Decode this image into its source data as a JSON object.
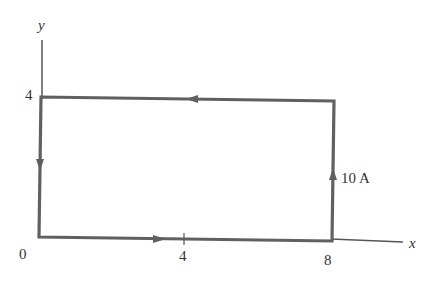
{
  "diagram": {
    "axes": {
      "x_label": "x",
      "y_label": "y",
      "origin_label": "0",
      "x_ticks": [
        "4",
        "8"
      ],
      "y_ticks": [
        "4"
      ]
    },
    "loop": {
      "corners": [
        [
          0,
          0
        ],
        [
          8,
          0
        ],
        [
          8,
          4
        ],
        [
          0,
          4
        ]
      ],
      "current_label": "10 A",
      "direction": "counterclockwise"
    },
    "colors": {
      "wire": "#606060",
      "axis": "#555555",
      "text": "#333333"
    }
  }
}
